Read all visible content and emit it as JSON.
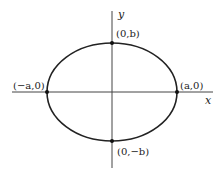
{
  "diagram": {
    "type": "ellipse",
    "axes": {
      "x_label": "x",
      "y_label": "y"
    },
    "points": {
      "top": "(0,b)",
      "bottom": "(0,−b)",
      "left": "(−a,0)",
      "right": "(a,0)"
    },
    "colors": {
      "stroke": "#222222",
      "axis": "#444444",
      "background": "#ffffff"
    }
  }
}
